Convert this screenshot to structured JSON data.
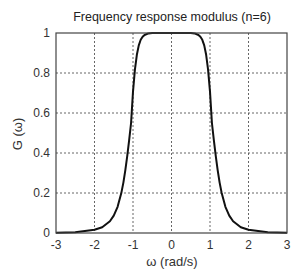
{
  "chart_data": {
    "type": "line",
    "title": "Frequency response modulus (n=6)",
    "xlabel": "ω (rad/s)",
    "ylabel": "G (ω)",
    "xlim": [
      -3,
      3
    ],
    "ylim": [
      0,
      1
    ],
    "grid": true,
    "legend": null,
    "x_ticks": [
      -3,
      -2,
      -1,
      0,
      1,
      2,
      3
    ],
    "y_ticks": [
      0,
      0.2,
      0.4,
      0.6,
      0.8,
      1
    ],
    "x_tick_labels": [
      "-3",
      "-2",
      "-1",
      "0",
      "1",
      "2",
      "3"
    ],
    "y_tick_labels": [
      "0",
      "0.2",
      "0.4",
      "0.6",
      "0.8",
      "1"
    ],
    "series": [
      {
        "name": "G(ω) = 1/sqrt(1+ω^12)",
        "x": [
          -3,
          -2.5,
          -2,
          -1.8,
          -1.6,
          -1.5,
          -1.4,
          -1.3,
          -1.25,
          -1.2,
          -1.15,
          -1.1,
          -1.05,
          -1,
          -0.95,
          -0.9,
          -0.85,
          -0.8,
          -0.75,
          -0.7,
          -0.6,
          -0.5,
          0,
          0.5,
          0.6,
          0.7,
          0.75,
          0.8,
          0.85,
          0.9,
          0.95,
          1,
          1.05,
          1.1,
          1.15,
          1.2,
          1.25,
          1.3,
          1.4,
          1.5,
          1.6,
          1.8,
          2,
          2.5,
          3
        ],
        "y": [
          0.001,
          0.004,
          0.016,
          0.029,
          0.059,
          0.087,
          0.131,
          0.203,
          0.252,
          0.313,
          0.384,
          0.464,
          0.55,
          0.707,
          0.817,
          0.891,
          0.938,
          0.966,
          0.981,
          0.99,
          0.998,
          1.0,
          1.0,
          1.0,
          0.998,
          0.99,
          0.981,
          0.966,
          0.938,
          0.891,
          0.817,
          0.707,
          0.55,
          0.464,
          0.384,
          0.313,
          0.252,
          0.203,
          0.131,
          0.087,
          0.059,
          0.029,
          0.016,
          0.004,
          0.001
        ]
      }
    ]
  }
}
